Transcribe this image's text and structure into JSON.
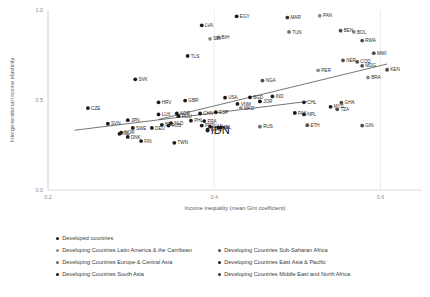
{
  "chart_data": {
    "type": "scatter",
    "title": "",
    "xlabel": "Income inequality (mean Gini coefficient)",
    "ylabel": "Intergenerational income elasticity",
    "xlim": [
      0.2,
      0.65
    ],
    "ylim": [
      0.0,
      1.0
    ],
    "xticks": [
      0.2,
      0.4,
      0.6
    ],
    "xtick_labels": [
      "0.2",
      "0.4",
      "0.6"
    ],
    "yticks": [
      0.0,
      0.5,
      1.0
    ],
    "ytick_labels": [
      "0.0",
      "0.5",
      "1.0"
    ],
    "grid": "y-gridlines only",
    "legend_position": "below-plot",
    "series": [
      {
        "name": "Developed countries",
        "color": "#1a1a1a",
        "points": [
          {
            "label": "EGY",
            "x": 0.427,
            "y": 0.965
          },
          {
            "label": "LVA",
            "x": 0.385,
            "y": 0.915
          },
          {
            "label": "TLS",
            "x": 0.368,
            "y": 0.745
          },
          {
            "label": "SVK",
            "x": 0.305,
            "y": 0.615
          },
          {
            "label": "CZE",
            "x": 0.248,
            "y": 0.455
          },
          {
            "label": "HRV",
            "x": 0.333,
            "y": 0.487
          },
          {
            "label": "GBR",
            "x": 0.365,
            "y": 0.497
          },
          {
            "label": "USA",
            "x": 0.413,
            "y": 0.513
          },
          {
            "label": "LUX",
            "x": 0.333,
            "y": 0.42
          },
          {
            "label": "KOR",
            "x": 0.355,
            "y": 0.425
          },
          {
            "label": "ROU",
            "x": 0.357,
            "y": 0.41
          },
          {
            "label": "CHN",
            "x": 0.383,
            "y": 0.425
          },
          {
            "label": "ESP",
            "x": 0.402,
            "y": 0.432
          },
          {
            "label": "SWE",
            "x": 0.302,
            "y": 0.345
          },
          {
            "label": "JPN",
            "x": 0.296,
            "y": 0.388
          },
          {
            "label": "SVN",
            "x": 0.272,
            "y": 0.368
          },
          {
            "label": "NOR",
            "x": 0.288,
            "y": 0.318
          },
          {
            "label": "ISL",
            "x": 0.286,
            "y": 0.312
          },
          {
            "label": "DNK",
            "x": 0.296,
            "y": 0.295
          },
          {
            "label": "FIN",
            "x": 0.312,
            "y": 0.272
          },
          {
            "label": "NLD",
            "x": 0.348,
            "y": 0.372
          },
          {
            "label": "AUS",
            "x": 0.345,
            "y": 0.358
          },
          {
            "label": "DEU",
            "x": 0.325,
            "y": 0.345
          },
          {
            "label": "IRL",
            "x": 0.408,
            "y": 0.348
          },
          {
            "label": "PRT",
            "x": 0.385,
            "y": 0.358
          },
          {
            "label": "CAN",
            "x": 0.395,
            "y": 0.352
          },
          {
            "label": "GRC",
            "x": 0.392,
            "y": 0.335
          },
          {
            "label": "ITA",
            "x": 0.405,
            "y": 0.345
          },
          {
            "label": "FRA",
            "x": 0.388,
            "y": 0.383
          },
          {
            "label": "TWN",
            "x": 0.352,
            "y": 0.262
          },
          {
            "label": "BEL",
            "x": 0.337,
            "y": 0.362
          }
        ]
      },
      {
        "name": "Developing Countries Latin America & the Carribean",
        "color": "#8c8c8c",
        "points": [
          {
            "label": "PAN",
            "x": 0.527,
            "y": 0.968
          },
          {
            "label": "BOL",
            "x": 0.568,
            "y": 0.878
          },
          {
            "label": "PER",
            "x": 0.525,
            "y": 0.665
          },
          {
            "label": "BRA",
            "x": 0.585,
            "y": 0.625
          },
          {
            "label": "SLV",
            "x": 0.395,
            "y": 0.84
          },
          {
            "label": "MKD",
            "x": 0.432,
            "y": 0.455
          }
        ]
      },
      {
        "name": "Developing Countries Sub-Saharan Africa",
        "color": "#4d4d4d",
        "points": [
          {
            "label": "BEN",
            "x": 0.552,
            "y": 0.885
          },
          {
            "label": "RWA",
            "x": 0.578,
            "y": 0.83
          },
          {
            "label": "MWI",
            "x": 0.592,
            "y": 0.76
          },
          {
            "label": "NER",
            "x": 0.555,
            "y": 0.72
          },
          {
            "label": "COD",
            "x": 0.572,
            "y": 0.712
          },
          {
            "label": "MDG",
            "x": 0.578,
            "y": 0.69
          },
          {
            "label": "KEN",
            "x": 0.608,
            "y": 0.668
          },
          {
            "label": "NGA",
            "x": 0.458,
            "y": 0.608
          },
          {
            "label": "GHA",
            "x": 0.553,
            "y": 0.485
          },
          {
            "label": "TZA",
            "x": 0.548,
            "y": 0.448
          },
          {
            "label": "ETH",
            "x": 0.512,
            "y": 0.36
          },
          {
            "label": "GIN",
            "x": 0.578,
            "y": 0.358
          }
        ]
      },
      {
        "name": "Developing Countries Europe & Central Asia",
        "color": "#6e6e6e",
        "points": [
          {
            "label": "BIH",
            "x": 0.405,
            "y": 0.848
          },
          {
            "label": "RUS",
            "x": 0.455,
            "y": 0.352
          },
          {
            "label": "TUN",
            "x": 0.49,
            "y": 0.878
          }
        ]
      },
      {
        "name": "Developing Countries East Asia & Pacific",
        "color": "#1f1f1f",
        "points": [
          {
            "label": "VNM",
            "x": 0.428,
            "y": 0.478
          },
          {
            "label": "IDN",
            "x": 0.392,
            "y": 0.33
          },
          {
            "label": "MYS",
            "x": 0.54,
            "y": 0.462
          },
          {
            "label": "CHL",
            "x": 0.508,
            "y": 0.487
          },
          {
            "label": "IND",
            "x": 0.47,
            "y": 0.52
          },
          {
            "label": "NPL",
            "x": 0.508,
            "y": 0.42
          },
          {
            "label": "PHL",
            "x": 0.372,
            "y": 0.385
          }
        ]
      },
      {
        "name": "Developing Countries South Asia",
        "color": "#111111",
        "points": [
          {
            "label": "BGD",
            "x": 0.443,
            "y": 0.515
          },
          {
            "label": "PAK",
            "x": 0.497,
            "y": 0.428
          },
          {
            "label": "JOR",
            "x": 0.455,
            "y": 0.492
          }
        ]
      },
      {
        "name": "Developing Countries Middle East and North Africa",
        "color": "#333333",
        "points": [
          {
            "label": "MAR",
            "x": 0.488,
            "y": 0.958
          }
        ]
      }
    ],
    "trendlines": [
      {
        "name": "upper-trend",
        "x0": 0.333,
        "y0": 0.392,
        "x1": 0.608,
        "y1": 0.7
      },
      {
        "name": "lower-trend",
        "x0": 0.232,
        "y0": 0.332,
        "x1": 0.512,
        "y1": 0.492
      }
    ]
  },
  "legend": {
    "items": [
      {
        "label": "Developed countries",
        "color": "#1a1a1a"
      },
      {
        "label": "Developing Countries Latin America & the Carribean",
        "color": "#8c8c8c"
      },
      {
        "label": "Developing Countries Sub-Saharan Africa",
        "color": "#4d4d4d"
      },
      {
        "label": "Developing Countries Europe & Central Asia",
        "color": "#6e6e6e"
      },
      {
        "label": "Developing Countries East Asia & Pacific",
        "color": "#1f1f1f"
      },
      {
        "label": "Developing Countries South Asia",
        "color": "#111111"
      },
      {
        "label": "Developing Countries Middle East and North Africa",
        "color": "#333333"
      }
    ]
  }
}
